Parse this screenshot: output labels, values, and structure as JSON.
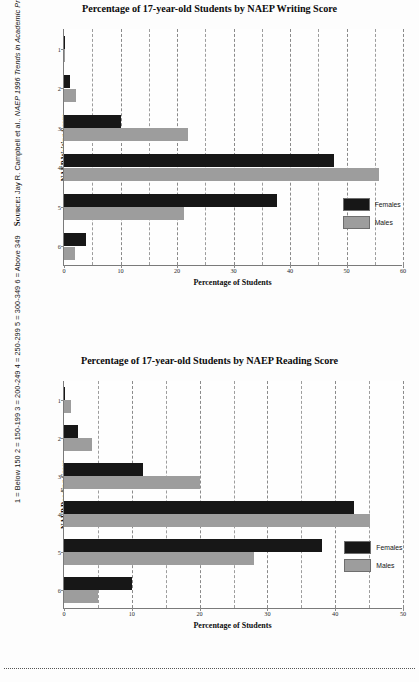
{
  "page": {
    "side_note": {
      "score_key": "1 = Below 150   2 = 150-199   3 = 200-249   4 = 250-299   5 = 300-349   6 = Above 349",
      "source_label": "Source:",
      "source_text_pre": "Jay R. Campbell et al., ",
      "source_text_italic": "NAEP 1996 Trends in Academic Progress",
      "source_text_post": " (Washington, DC: U.S. Department of Education, National Center for Education Statistics, 1997)."
    },
    "colors": {
      "females": "#171717",
      "males": "#9d9d9d",
      "axis": "#7a7a7a",
      "grid": "#9d9d9d",
      "background": "#fdfdfd"
    }
  },
  "chart_data": [
    {
      "id": "writing",
      "type": "bar",
      "orientation": "horizontal",
      "title": "Percentage of 17-year-old Students by NAEP Writing Score",
      "xlabel": "Percentage of Students",
      "ylabel": "NAEP Writing Score",
      "categories": [
        "1",
        "2",
        "3",
        "4",
        "5",
        "6"
      ],
      "xlim": [
        0,
        60
      ],
      "xticks": [
        0,
        10,
        20,
        30,
        40,
        50,
        60
      ],
      "xtick_labels": [
        "0",
        "10",
        "20",
        "30",
        "40",
        "50",
        "60"
      ],
      "minor_gridlines": [
        5,
        15,
        25,
        35,
        45,
        55
      ],
      "grid": true,
      "legend_position": "bottom-right",
      "series": [
        {
          "name": "Females",
          "color": "#171717",
          "values": [
            0.2,
            1.0,
            10.0,
            47.8,
            37.7,
            3.9
          ]
        },
        {
          "name": "Males",
          "color": "#9d9d9d",
          "values": [
            0.2,
            2.1,
            22.0,
            55.8,
            21.2,
            2.0
          ]
        }
      ]
    },
    {
      "id": "reading",
      "type": "bar",
      "orientation": "horizontal",
      "title": "Percentage of 17-year-old Students by NAEP Reading Score",
      "xlabel": "Percentage of Students",
      "ylabel": "NAEP Reading Score",
      "categories": [
        "1",
        "2",
        "3",
        "4",
        "5",
        "6"
      ],
      "xlim": [
        0,
        50
      ],
      "xticks": [
        0,
        10,
        20,
        30,
        40,
        50
      ],
      "xtick_labels": [
        "0",
        "10",
        "20",
        "30",
        "40",
        "50"
      ],
      "minor_gridlines": [
        5,
        15,
        25,
        35,
        45
      ],
      "grid": true,
      "legend_position": "bottom-right",
      "series": [
        {
          "name": "Females",
          "color": "#171717",
          "values": [
            0.1,
            2.0,
            11.7,
            42.8,
            38.0,
            10.0
          ]
        },
        {
          "name": "Males",
          "color": "#9d9d9d",
          "values": [
            1.0,
            4.2,
            20.0,
            45.2,
            28.0,
            5.0
          ]
        }
      ]
    }
  ]
}
